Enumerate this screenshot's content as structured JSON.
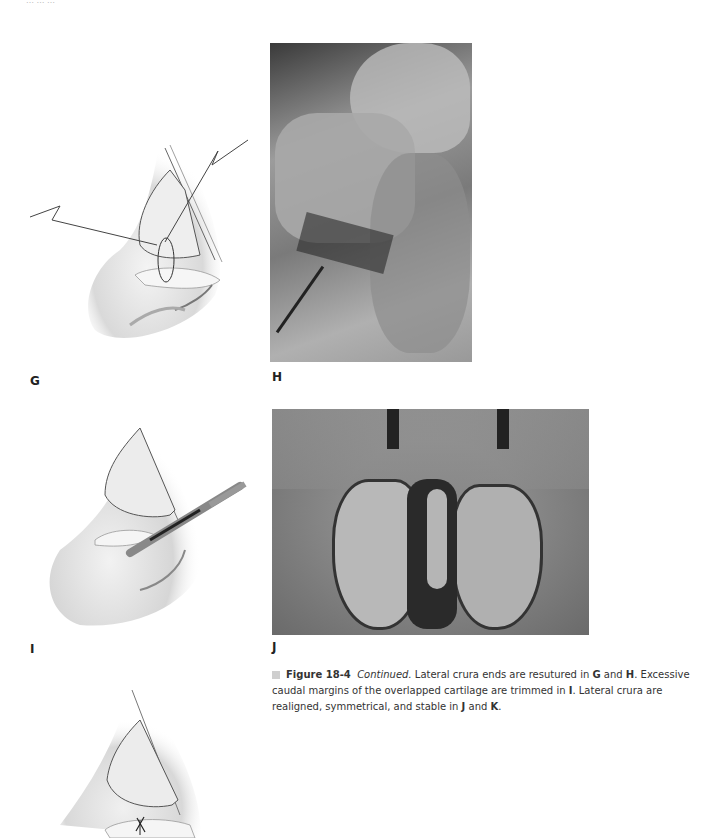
{
  "page": {
    "header_fragment": "… … …"
  },
  "panels": [
    {
      "id": "G",
      "label": "G",
      "type": "illustration",
      "subject": "nose lateral view, lateral crura ends resutured with suture needle"
    },
    {
      "id": "H",
      "label": "H",
      "type": "photograph",
      "subject": "intraoperative photo of resutured lateral crura with forceps"
    },
    {
      "id": "I",
      "label": "I",
      "type": "illustration",
      "subject": "nose lateral view, scalpel trimming caudal margin of overlapped cartilage"
    },
    {
      "id": "J",
      "label": "J",
      "type": "photograph",
      "subject": "intraoperative basal view of realigned symmetrical lateral crura"
    },
    {
      "id": "K",
      "label": "K",
      "type": "illustration",
      "subject": "nose lateral view with stitched lateral crus (partially visible)"
    }
  ],
  "caption": {
    "figure_number": "Figure 18-4",
    "continued": "Continued.",
    "text_1": " Lateral crura ends are resutured in ",
    "G": "G",
    "text_2": " and ",
    "H": "H",
    "text_3": ". Excessive caudal margins of the overlapped cartilage are trimmed in ",
    "I": "I",
    "text_4": ". Lateral crura are realigned, symmetrical, and stable in ",
    "J": "J",
    "text_5": " and ",
    "K": "K",
    "text_6": "."
  }
}
